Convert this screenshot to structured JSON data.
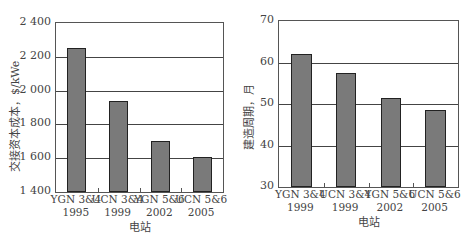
{
  "chart_data": [
    {
      "type": "bar",
      "title": "",
      "xlabel": "电站",
      "ylabel": "交接资本成本，$/kWe",
      "categories": [
        "YGN 3&4 1995",
        "UCN 3&4 1999",
        "YGN 5&6 2002",
        "UCN 5&6 2005"
      ],
      "category_lines": [
        [
          "YGN 3&4",
          "1995"
        ],
        [
          "UCN 3&4",
          "1999"
        ],
        [
          "YGN 5&6",
          "2002"
        ],
        [
          "UCN 5&6",
          "2005"
        ]
      ],
      "values": [
        2250,
        1940,
        1700,
        1610
      ],
      "ylim": [
        1400,
        2400
      ],
      "yticks": [
        "1 400",
        "1 600",
        "1 800",
        "2 000",
        "2 200",
        "2 400"
      ],
      "grid": true,
      "bar_color": "#7a7a7a"
    },
    {
      "type": "bar",
      "title": "",
      "xlabel": "电站",
      "ylabel": "建造周期，月",
      "categories": [
        "YGN 3&4 1999",
        "UCN 3&4 1999",
        "YGN 5&6 2002",
        "UCN 5&6 2005"
      ],
      "category_lines": [
        [
          "YGN 3&4",
          "1999"
        ],
        [
          "UCN 3&4",
          "1999"
        ],
        [
          "YGN 5&6",
          "2002"
        ],
        [
          "UCN 5&6",
          "2005"
        ]
      ],
      "values": [
        62,
        57.5,
        51.5,
        48.5
      ],
      "ylim": [
        30,
        70
      ],
      "yticks": [
        "30",
        "40",
        "50",
        "60",
        "70"
      ],
      "grid": true,
      "bar_color": "#7a7a7a"
    }
  ]
}
